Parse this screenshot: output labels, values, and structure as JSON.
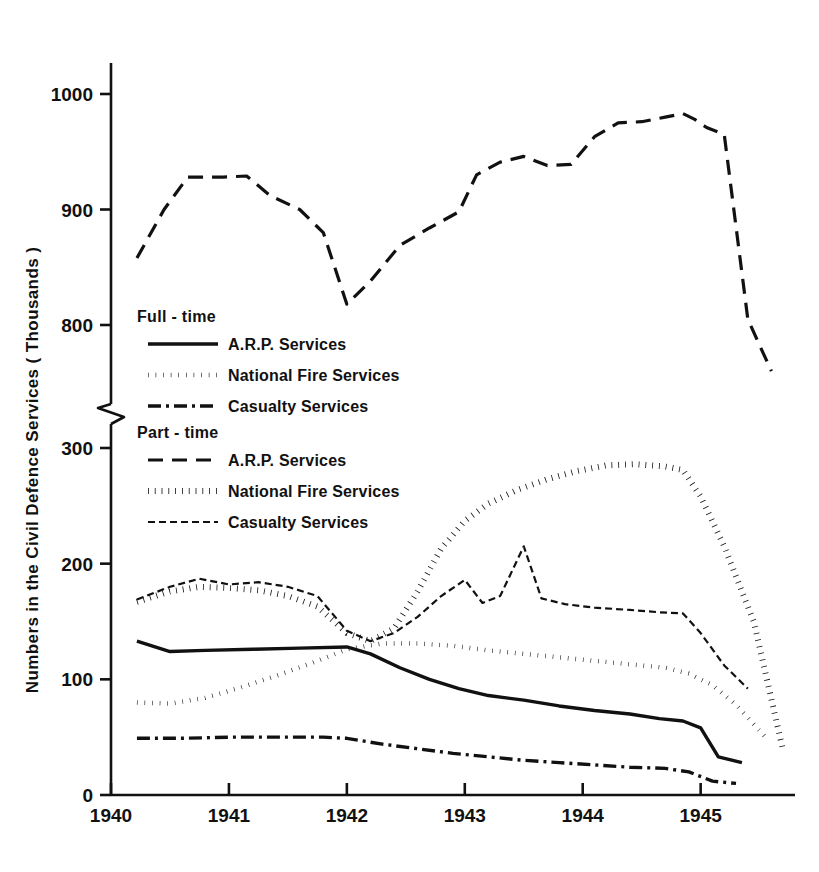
{
  "chart_data": {
    "type": "line",
    "title": "",
    "xlabel": "",
    "ylabel": "Numbers in the Civil Defence Services ( Thousands )",
    "axis_break": true,
    "upper_panel": {
      "ylim": [
        760,
        1030
      ],
      "yticks": [
        800,
        900,
        1000
      ],
      "ytick_labels": [
        "800",
        "900",
        "1000"
      ]
    },
    "lower_panel": {
      "ylim": [
        0,
        320
      ],
      "yticks": [
        0,
        100,
        200,
        300
      ],
      "ytick_labels": [
        "0",
        "100",
        "200",
        "300"
      ]
    },
    "xlim": [
      1940.0,
      1945.8
    ],
    "xticks": [
      1940,
      1941,
      1942,
      1943,
      1944,
      1945
    ],
    "xtick_labels": [
      "1940",
      "1941",
      "1942",
      "1943",
      "1944",
      "1945"
    ],
    "grid": false,
    "legend_position": "inside-left",
    "series": [
      {
        "name": "Part-time Casualty Services (upper panel)",
        "group": "Part-time",
        "style": "long-dash",
        "panel": "upper",
        "x": [
          1940.22,
          1940.45,
          1940.65,
          1940.95,
          1941.15,
          1941.35,
          1941.6,
          1941.8,
          1942.0,
          1942.2,
          1942.45,
          1942.7,
          1942.95,
          1943.1,
          1943.3,
          1943.5,
          1943.7,
          1943.9,
          1944.1,
          1944.3,
          1944.5,
          1944.7,
          1944.85,
          1944.95,
          1945.05,
          1945.2,
          1945.4,
          1945.6
        ],
        "y": [
          858,
          900,
          928,
          928,
          929,
          912,
          900,
          880,
          818,
          838,
          869,
          884,
          898,
          930,
          941,
          946,
          938,
          939,
          963,
          975,
          976,
          980,
          983,
          978,
          971,
          965,
          805,
          760
        ]
      },
      {
        "name": "Part-time National Fire Services",
        "group": "Part-time",
        "style": "thick-dotted",
        "panel": "lower",
        "x": [
          1940.22,
          1940.5,
          1940.75,
          1941.0,
          1941.25,
          1941.5,
          1941.75,
          1942.0,
          1942.2,
          1942.4,
          1942.6,
          1942.8,
          1943.0,
          1943.2,
          1943.45,
          1943.7,
          1943.95,
          1944.2,
          1944.45,
          1944.7,
          1944.85,
          1945.0,
          1945.2,
          1945.45,
          1945.7
        ],
        "y": [
          167,
          176,
          180,
          179,
          177,
          172,
          163,
          140,
          133,
          144,
          176,
          213,
          237,
          252,
          264,
          273,
          280,
          285,
          286,
          284,
          281,
          258,
          215,
          150,
          38
        ]
      },
      {
        "name": "Part-time Casualty Services",
        "group": "Part-time",
        "style": "thin-dashed",
        "panel": "lower",
        "x": [
          1940.22,
          1940.5,
          1940.75,
          1941.0,
          1941.25,
          1941.5,
          1941.75,
          1942.0,
          1942.2,
          1942.4,
          1942.6,
          1942.8,
          1943.0,
          1943.15,
          1943.3,
          1943.5,
          1943.65,
          1943.85,
          1944.1,
          1944.4,
          1944.65,
          1944.85,
          1945.0,
          1945.2,
          1945.4
        ],
        "y": [
          169,
          180,
          187,
          182,
          184,
          180,
          172,
          142,
          133,
          140,
          154,
          172,
          186,
          166,
          172,
          215,
          170,
          165,
          162,
          160,
          158,
          157,
          140,
          112,
          92
        ]
      },
      {
        "name": "Full-time A.R.P. Services",
        "group": "Full-time",
        "style": "solid",
        "panel": "lower",
        "x": [
          1940.22,
          1940.5,
          1940.8,
          1941.2,
          1941.6,
          1942.0,
          1942.2,
          1942.45,
          1942.7,
          1942.95,
          1943.2,
          1943.5,
          1943.8,
          1944.1,
          1944.4,
          1944.65,
          1944.85,
          1945.0,
          1945.15,
          1945.35
        ],
        "y": [
          133,
          124,
          125,
          126,
          127,
          128,
          122,
          110,
          100,
          92,
          86,
          82,
          77,
          73,
          70,
          66,
          64,
          58,
          33,
          28
        ]
      },
      {
        "name": "Full-time National Fire Services",
        "group": "Full-time",
        "style": "dotted",
        "panel": "lower",
        "x": [
          1940.22,
          1940.5,
          1940.8,
          1941.1,
          1941.4,
          1941.7,
          1942.0,
          1942.3,
          1942.6,
          1942.9,
          1943.2,
          1943.5,
          1943.8,
          1944.1,
          1944.4,
          1944.7,
          1944.9,
          1945.1,
          1945.3,
          1945.55
        ],
        "y": [
          80,
          79,
          84,
          93,
          103,
          114,
          126,
          131,
          131,
          129,
          125,
          122,
          119,
          116,
          113,
          110,
          105,
          95,
          78,
          50
        ]
      },
      {
        "name": "Full-time Casualty Services",
        "group": "Full-time",
        "style": "dash-dot",
        "panel": "lower",
        "x": [
          1940.22,
          1940.6,
          1941.0,
          1941.4,
          1941.8,
          1942.0,
          1942.3,
          1942.6,
          1942.9,
          1943.2,
          1943.5,
          1943.8,
          1944.1,
          1944.4,
          1944.7,
          1944.9,
          1945.1,
          1945.3
        ],
        "y": [
          49,
          49,
          50,
          50,
          50,
          49,
          44,
          40,
          36,
          33,
          30,
          28,
          26,
          24,
          23,
          20,
          12,
          10
        ]
      }
    ]
  },
  "axes": {
    "y_title": "Numbers in the Civil Defence Services ( Thousands )",
    "y_ticks_upper": [
      "1000",
      "900",
      "800"
    ],
    "y_ticks_lower": [
      "300",
      "200",
      "100",
      "0"
    ],
    "x_ticks": [
      "1940",
      "1941",
      "1942",
      "1943",
      "1944",
      "1945"
    ]
  },
  "legend": {
    "fulltime": {
      "heading": "Full - time",
      "items": [
        {
          "label": "A.R.P. Services",
          "style": "solid"
        },
        {
          "label": "National Fire Services",
          "style": "dotted"
        },
        {
          "label": "Casualty Services",
          "style": "dash-dot"
        }
      ]
    },
    "parttime": {
      "heading": "Part - time",
      "items": [
        {
          "label": "A.R.P. Services",
          "style": "long-dash"
        },
        {
          "label": "National Fire Services",
          "style": "thick-dotted"
        },
        {
          "label": "Casualty Services",
          "style": "thin-dashed"
        }
      ]
    }
  },
  "colors": {
    "ink": "#111111",
    "background": "#ffffff"
  }
}
